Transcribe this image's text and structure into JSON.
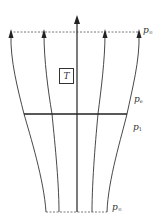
{
  "figure": {
    "type": "streamtube-actuator-diagram",
    "labels": {
      "top_pressure": {
        "symbol": "p",
        "subscript": "∞"
      },
      "exit_pressure": {
        "symbol": "p",
        "subscript": "e"
      },
      "plane_pressure": {
        "symbol": "p",
        "subscript": "1"
      },
      "bottom_pressure": {
        "symbol": "p",
        "subscript": "∞"
      }
    },
    "thrust_box": {
      "label": "T"
    },
    "colors": {
      "line": "#333333",
      "dashed": "#555555",
      "background": "#ffffff"
    }
  }
}
